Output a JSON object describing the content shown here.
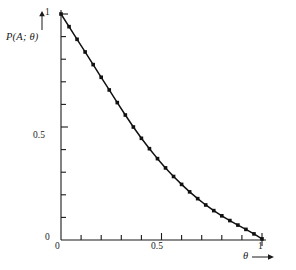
{
  "chart_data": {
    "type": "line",
    "title": "",
    "subtitle": "",
    "xlabel": "θ",
    "ylabel": "P(A; θ)",
    "xlim": [
      0,
      1
    ],
    "ylim": [
      0,
      1
    ],
    "grid": false,
    "legend": null,
    "x_ticks_major": [
      0,
      0.5,
      1
    ],
    "x_tick_labels": [
      "0",
      "0.5",
      "1"
    ],
    "y_ticks_major": [
      0,
      0.5,
      1
    ],
    "y_tick_labels": [
      "0",
      "0.5",
      "1"
    ],
    "x_ticks_minor": [
      0.1,
      0.2,
      0.3,
      0.4,
      0.6,
      0.7,
      0.8,
      0.9
    ],
    "y_ticks_minor": [
      0.1,
      0.2,
      0.3,
      0.4,
      0.6,
      0.7,
      0.8,
      0.9
    ],
    "marker": "square",
    "line_color": "#111111",
    "marker_color": "#111111",
    "axis_color": "#1a1a1a",
    "background": "#ffffff",
    "series": [
      {
        "name": "P(A; θ)",
        "x": [
          0.0,
          0.04,
          0.08,
          0.12,
          0.16,
          0.2,
          0.24,
          0.28,
          0.32,
          0.36,
          0.4,
          0.44,
          0.48,
          0.52,
          0.56,
          0.6,
          0.64,
          0.68,
          0.72,
          0.76,
          0.8,
          0.84,
          0.88,
          0.92,
          0.96,
          1.0
        ],
        "y": [
          1.0,
          0.944,
          0.888,
          0.832,
          0.776,
          0.72,
          0.664,
          0.608,
          0.553,
          0.5,
          0.45,
          0.404,
          0.36,
          0.319,
          0.281,
          0.246,
          0.213,
          0.183,
          0.155,
          0.13,
          0.107,
          0.086,
          0.066,
          0.047,
          0.027,
          0.005
        ]
      }
    ],
    "axis_ticks_direction": "inward",
    "x_label_arrow": "→",
    "y_label_arrow": "↑"
  },
  "labels": {
    "y_axis_text": "P(A; θ)",
    "x_axis_text": "θ",
    "y_tick_1": "1",
    "y_tick_05": "0.5",
    "y_tick_0": "0",
    "x_tick_0": "0",
    "x_tick_05": "0.5",
    "x_tick_1": "1"
  }
}
